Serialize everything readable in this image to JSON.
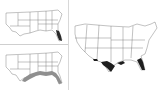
{
  "figure": {
    "panels": [
      {
        "id": "a",
        "label": "",
        "region": "Southeastern United States",
        "highlight": "Florida",
        "fill": "#2a2a2a"
      },
      {
        "id": "b",
        "region": "Southeastern United States",
        "highlight": "Gulf coast states coastal band",
        "fill": "#8f8f8f"
      },
      {
        "id": "c",
        "region": "Contiguous United States",
        "highlight": "Gulf coast: Texas coast, Louisiana, Florida",
        "fill": "#1e1e1e"
      }
    ],
    "colors": {
      "outline": "#555555",
      "divider": "#d8d8d8"
    }
  }
}
